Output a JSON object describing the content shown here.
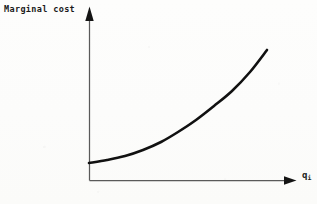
{
  "figure": {
    "background_color": "#fdfdfc",
    "ink_color": "#1b1b1b",
    "curve_color": "#111111",
    "axis_color": "#5a5a5a"
  },
  "labels": {
    "y_axis": "Marginal cost",
    "x_axis_base": "q",
    "x_axis_subscript": "i"
  },
  "icons": {
    "y_axis_arrow": "arrow-up-icon",
    "x_axis_arrow": "arrow-right-icon"
  },
  "chart_data": {
    "type": "line",
    "title": "",
    "xlabel": "q_i",
    "ylabel": "Marginal cost",
    "grid": false,
    "legend": null,
    "annotations": [],
    "axis_ranges": {
      "x": [
        0,
        1
      ],
      "y": [
        0,
        1
      ]
    },
    "tick_labels": {
      "x": [],
      "y": []
    },
    "series": [
      {
        "name": "Marginal cost",
        "x": [
          0.0,
          0.1,
          0.2,
          0.3,
          0.4,
          0.5,
          0.6,
          0.7,
          0.8,
          0.9,
          1.0
        ],
        "y": [
          0.098,
          0.118,
          0.15,
          0.196,
          0.255,
          0.327,
          0.413,
          0.511,
          0.623,
          0.748,
          0.886
        ],
        "pixel_points": [
          [
            89,
            163
          ],
          [
            107,
            160
          ],
          [
            125,
            156
          ],
          [
            143,
            150
          ],
          [
            161,
            142
          ],
          [
            178,
            132
          ],
          [
            196,
            120
          ],
          [
            214,
            106
          ],
          [
            232,
            91
          ],
          [
            250,
            72
          ],
          [
            267,
            50
          ]
        ]
      }
    ]
  },
  "geometry": {
    "y_axis": {
      "x": 89.5,
      "y_top": 20,
      "y_bottom": 180.5
    },
    "y_arrow": {
      "tip_x": 89.5,
      "tip_y": 6.5,
      "half_width": 4.2,
      "base_y": 21
    },
    "x_axis": {
      "y": 180.5,
      "x_left": 89.5,
      "x_right": 288
    },
    "x_arrow": {
      "tip_x": 296.5,
      "tip_y": 180.5,
      "half_height": 4.2,
      "base_x": 284
    }
  }
}
